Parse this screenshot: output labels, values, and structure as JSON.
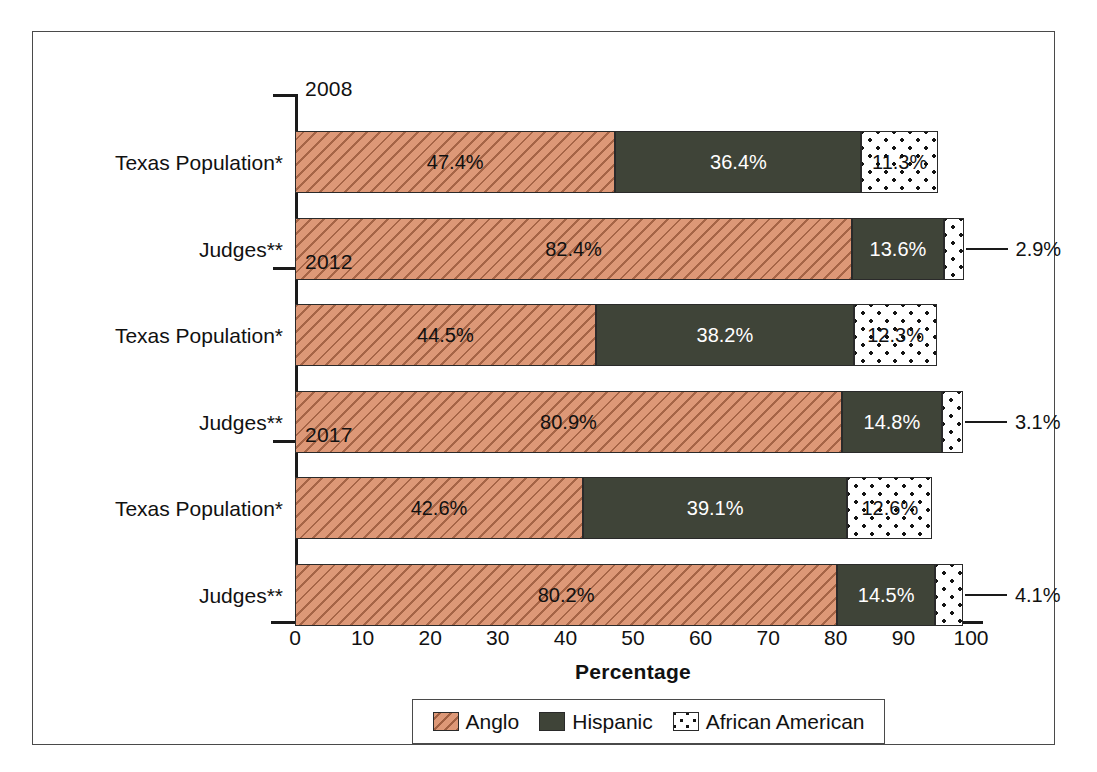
{
  "chart_data": {
    "type": "bar",
    "subtype": "horizontal stacked bar, grouped by year",
    "title": "",
    "xlabel": "Percentage",
    "ylabel": "",
    "xlim": [
      0,
      100
    ],
    "xticks": [
      "0",
      "10",
      "20",
      "30",
      "40",
      "50",
      "60",
      "70",
      "80",
      "90",
      "100"
    ],
    "grid": false,
    "legend_position": "bottom-center",
    "series": [
      {
        "name": "Anglo",
        "color": "#dd9877",
        "pattern": "diagonal-hatch"
      },
      {
        "name": "Hispanic",
        "color": "#3f4438",
        "pattern": "solid"
      },
      {
        "name": "African American",
        "color": "#ffffff",
        "pattern": "dotted"
      }
    ],
    "groups": [
      {
        "year": "2008",
        "rows": [
          {
            "category": "Texas Population*",
            "values": [
              47.4,
              36.4,
              11.3
            ],
            "labels": [
              "47.4%",
              "36.4%",
              "11.3%"
            ],
            "callout": false
          },
          {
            "category": "Judges**",
            "values": [
              82.4,
              13.6,
              2.9
            ],
            "labels": [
              "82.4%",
              "13.6%",
              "2.9%"
            ],
            "callout": true,
            "callout_label": "2.9%"
          }
        ]
      },
      {
        "year": "2012",
        "rows": [
          {
            "category": "Texas Population*",
            "values": [
              44.5,
              38.2,
              12.3
            ],
            "labels": [
              "44.5%",
              "38.2%",
              "12.3%"
            ],
            "callout": false
          },
          {
            "category": "Judges**",
            "values": [
              80.9,
              14.8,
              3.1
            ],
            "labels": [
              "80.9%",
              "14.8%",
              "3.1%"
            ],
            "callout": true,
            "callout_label": "3.1%"
          }
        ]
      },
      {
        "year": "2017",
        "rows": [
          {
            "category": "Texas Population*",
            "values": [
              42.6,
              39.1,
              12.6
            ],
            "labels": [
              "42.6%",
              "39.1%",
              "12.6%"
            ],
            "callout": false
          },
          {
            "category": "Judges**",
            "values": [
              80.2,
              14.5,
              4.1
            ],
            "labels": [
              "80.2%",
              "14.5%",
              "4.1%"
            ],
            "callout": true,
            "callout_label": "4.1%"
          }
        ]
      }
    ]
  },
  "axis": {
    "x_title": "Percentage",
    "ticks": [
      "0",
      "10",
      "20",
      "30",
      "40",
      "50",
      "60",
      "70",
      "80",
      "90",
      "100"
    ]
  },
  "legend": {
    "items": [
      {
        "label": "Anglo",
        "swatch": "anglo-swatch-icon"
      },
      {
        "label": "Hispanic",
        "swatch": "hispanic-swatch-icon"
      },
      {
        "label": "African American",
        "swatch": "african-american-swatch-icon"
      }
    ]
  }
}
